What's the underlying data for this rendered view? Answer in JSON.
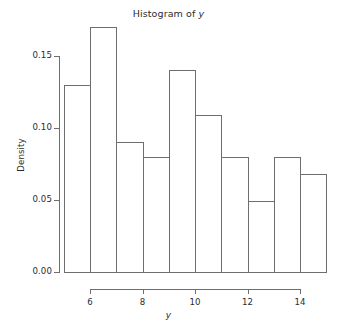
{
  "chart_data": {
    "type": "bar",
    "title": "Histogram of y",
    "title_prefix": "Histogram of ",
    "title_variable": "y",
    "xlabel": "y",
    "ylabel": "Density",
    "grid": false,
    "legend": null,
    "xlim": [
      5,
      15
    ],
    "ylim": [
      0.0,
      0.17
    ],
    "bin_width": 1,
    "bin_edges": [
      5,
      6,
      7,
      8,
      9,
      10,
      11,
      12,
      13,
      14,
      15
    ],
    "categories": [
      "5-6",
      "6-7",
      "7-8",
      "8-9",
      "9-10",
      "10-11",
      "11-12",
      "12-13",
      "13-14",
      "14-15"
    ],
    "values": [
      0.13,
      0.17,
      0.09,
      0.08,
      0.14,
      0.109,
      0.08,
      0.049,
      0.08,
      0.068
    ],
    "xticks": [
      6,
      8,
      10,
      12,
      14
    ],
    "xtick_labels": [
      "6",
      "8",
      "10",
      "12",
      "14"
    ],
    "yticks": [
      0.0,
      0.05,
      0.1,
      0.15
    ],
    "ytick_labels": [
      "0.00",
      "0.05",
      "0.10",
      "0.15"
    ],
    "bar_fill_color": "#ffffff",
    "bar_border_color": "#6e6e6e",
    "axis_color": "#6e6e6e",
    "text_color": "#2b2b2b",
    "background_color": "#ffffff"
  }
}
